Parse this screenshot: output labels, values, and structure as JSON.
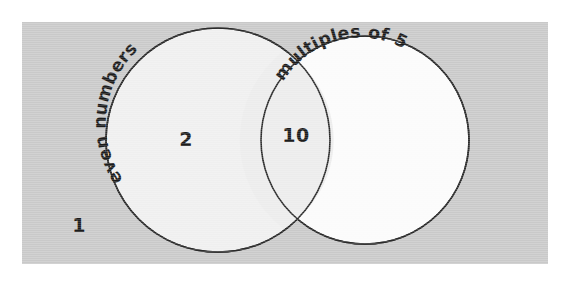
{
  "diagram": {
    "type": "venn",
    "background_color": "#ffffff",
    "panel": {
      "fill": "#c9c9c9",
      "x": 22,
      "y": 22,
      "width": 526,
      "height": 242
    },
    "sets": [
      {
        "id": "even-numbers",
        "label": "even numbers",
        "fill": "#efefef",
        "stroke": "#2a2a2a",
        "cx": 218,
        "cy": 140,
        "r": 112
      },
      {
        "id": "multiples-of-5",
        "label": "multiples of 5",
        "fill": "#fbfbfb",
        "stroke": "#2a2a2a",
        "cx": 365,
        "cy": 140,
        "r": 104
      }
    ],
    "regions": [
      {
        "id": "outside",
        "name": "outside-both-sets",
        "value": "1",
        "x": 79,
        "y": 232
      },
      {
        "id": "left-only",
        "name": "even-numbers-only",
        "value": "2",
        "x": 186,
        "y": 146
      },
      {
        "id": "intersection",
        "name": "even-and-multiple-of-5",
        "value": "10",
        "x": 296,
        "y": 142
      }
    ]
  }
}
